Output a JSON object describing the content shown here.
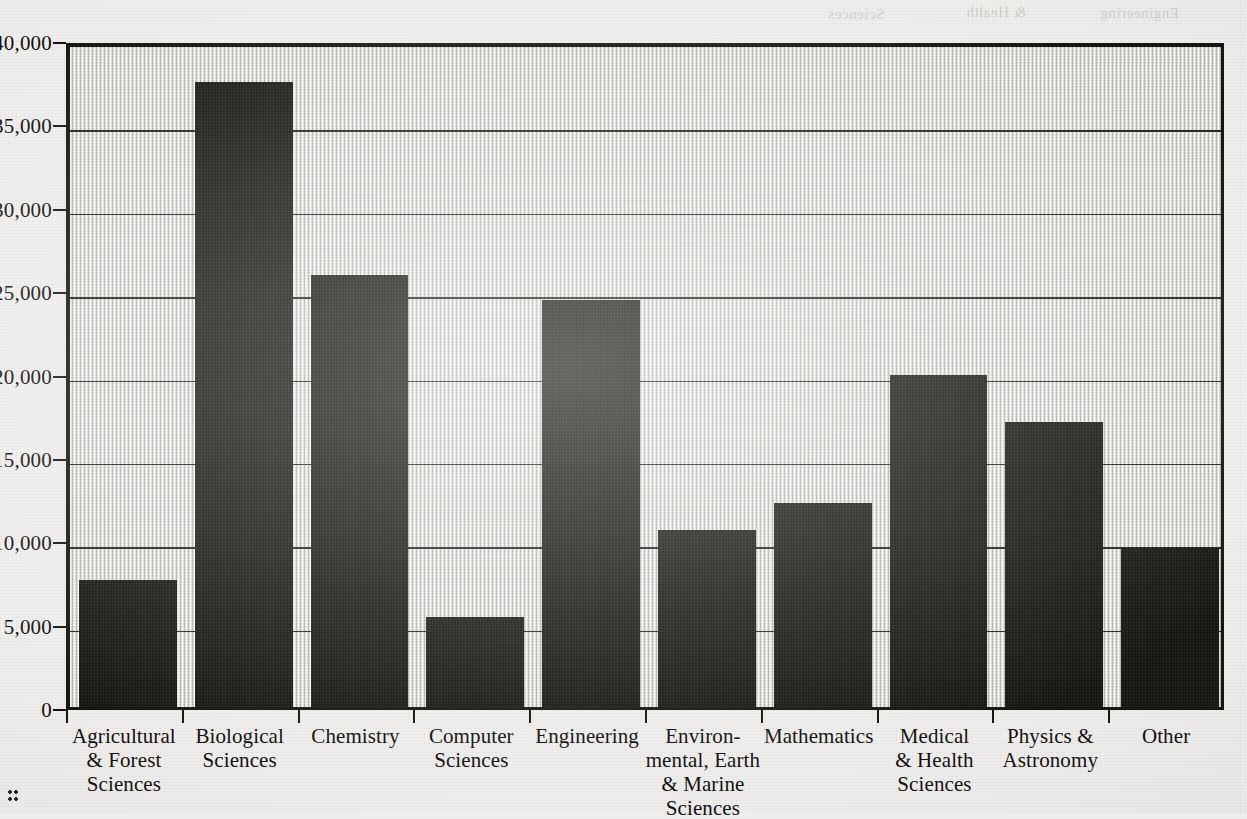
{
  "chart_data": {
    "type": "bar",
    "title": "",
    "xlabel": "",
    "ylabel": "",
    "ylim": [
      0,
      40000
    ],
    "grid": true,
    "legend": "none",
    "categories": [
      "Agricultural & Forest Sciences",
      "Biological Sciences",
      "Chemistry",
      "Computer Sciences",
      "Engineering",
      "Environmental, Earth & Marine Sciences",
      "Mathematics",
      "Medical & Health Sciences",
      "Physics & Astronomy",
      "Other"
    ],
    "category_lines": [
      [
        "Agricultural",
        "& Forest",
        "Sciences"
      ],
      [
        "Biological",
        "Sciences"
      ],
      [
        "Chemistry"
      ],
      [
        "Computer",
        "Sciences"
      ],
      [
        "Engineering"
      ],
      [
        "Environ-",
        "mental, Earth",
        "& Marine",
        "Sciences"
      ],
      [
        "Mathematics"
      ],
      [
        "Medical",
        "& Health",
        "Sciences"
      ],
      [
        "Physics &",
        "Astronomy"
      ],
      [
        "Other"
      ]
    ],
    "values": [
      7600,
      37500,
      25900,
      5400,
      24400,
      10600,
      12250,
      19900,
      17100,
      9550
    ],
    "ytick_values": [
      0,
      5000,
      10000,
      15000,
      20000,
      25000,
      30000,
      35000,
      40000
    ],
    "ytick_labels": [
      "0",
      "5,000",
      "10,000",
      "15,000",
      "20,000",
      "25,000",
      "30,000",
      "35,000",
      "40,000"
    ],
    "bar_color": "#15130f",
    "plot_background_color": "#d9d8d5",
    "axis_color": "#17150f",
    "page_background_color": "#efeeec"
  },
  "artifacts": {
    "bleed_text_a": "Sciences",
    "bleed_text_b": "& Health",
    "bleed_text_c": "Engineering"
  }
}
